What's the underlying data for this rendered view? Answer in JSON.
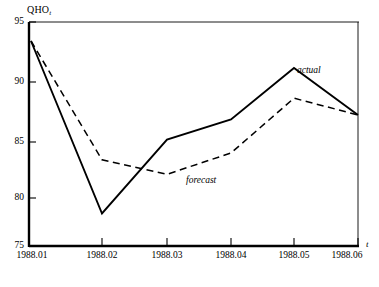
{
  "chart_data": {
    "type": "line",
    "title": "",
    "xlabel": "t",
    "ylabel": "QHO",
    "ylabel_subscript": "t",
    "categories": [
      "1988.01",
      "1988.02",
      "1988.03",
      "1988.04",
      "1988.05",
      "1988.06"
    ],
    "x_tick_labels": [
      "1988.01",
      "1988.02",
      "1988.03",
      "1988.04",
      "1988.05",
      "1988.06"
    ],
    "y_tick_labels": [
      "95",
      "90",
      "85",
      "80",
      "75"
    ],
    "y_ticks": [
      95,
      90,
      85,
      80,
      75
    ],
    "ylim": [
      75,
      95
    ],
    "grid": false,
    "legend_position": "inline-annotation",
    "series": [
      {
        "name": "actual",
        "label": "actual",
        "style": "solid",
        "color": "#000000",
        "values": [
          93.3,
          77.9,
          84.5,
          86.3,
          90.9,
          86.7
        ]
      },
      {
        "name": "forecast",
        "label": "forecast",
        "style": "dashed",
        "color": "#000000",
        "values": [
          93.3,
          82.7,
          81.4,
          83.3,
          88.2,
          86.7
        ]
      }
    ],
    "annotations": [
      {
        "text": "actual",
        "series": "actual"
      },
      {
        "text": "forecast",
        "series": "forecast"
      }
    ]
  },
  "axes": {
    "y_title": "QHO",
    "y_title_subscript": "t",
    "x_title": "t"
  }
}
